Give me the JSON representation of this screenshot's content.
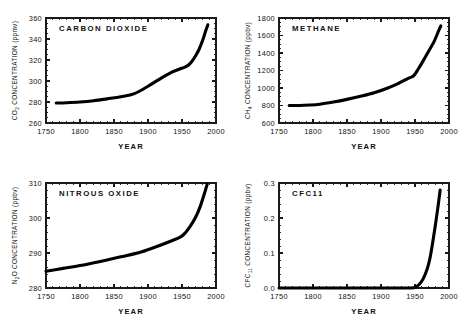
{
  "figure": {
    "background": "#ffffff",
    "ink": "#000000",
    "panel_count": 4
  },
  "chart_data": [
    {
      "type": "line",
      "title": "CARBON  DIOXIDE",
      "species": "CO2",
      "xlabel": "YEAR",
      "ylabel_main": "CO",
      "ylabel_sub": "2",
      "ylabel_tail": " CONCENTRATION (ppmv)",
      "units": "ppmv",
      "xlim": [
        1750,
        2000
      ],
      "ylim": [
        260,
        360
      ],
      "xticks": [
        1750,
        1800,
        1850,
        1900,
        1950,
        2000
      ],
      "yticks": [
        260,
        280,
        300,
        320,
        340,
        360
      ],
      "xtick_labels": [
        "1750",
        "1800",
        "1850",
        "1900",
        "1950",
        "2000"
      ],
      "ytick_labels": [
        "260",
        "280",
        "300",
        "320",
        "340",
        "360"
      ],
      "x_minor_step": 10,
      "y_minor_step": 5,
      "grid": false,
      "legend": "none",
      "x": [
        1765,
        1780,
        1800,
        1820,
        1840,
        1860,
        1880,
        1900,
        1920,
        1935,
        1945,
        1955,
        1960,
        1965,
        1970,
        1975,
        1980,
        1985,
        1988
      ],
      "y": [
        279.0,
        279.3,
        280.0,
        281.2,
        283.0,
        285.0,
        288.0,
        295.0,
        303.0,
        308.5,
        311.0,
        313.5,
        315.5,
        319.0,
        324.0,
        330.0,
        338.0,
        348.0,
        353.5
      ]
    },
    {
      "type": "line",
      "title": "METHANE",
      "species": "CH4",
      "xlabel": "YEAR",
      "ylabel_main": "CH",
      "ylabel_sub": "4",
      "ylabel_tail": " CONCENTRATION (ppbv)",
      "units": "ppbv",
      "xlim": [
        1750,
        2000
      ],
      "ylim": [
        600,
        1800
      ],
      "xticks": [
        1750,
        1800,
        1850,
        1900,
        1950,
        2000
      ],
      "yticks": [
        600,
        800,
        1000,
        1200,
        1400,
        1600,
        1800
      ],
      "xtick_labels": [
        "1750",
        "1800",
        "1850",
        "1900",
        "1950",
        "2000"
      ],
      "ytick_labels": [
        "600",
        "800",
        "1000",
        "1200",
        "1400",
        "1600",
        "1800"
      ],
      "x_minor_step": 10,
      "y_minor_step": 50,
      "grid": false,
      "legend": "none",
      "x": [
        1765,
        1780,
        1795,
        1810,
        1830,
        1850,
        1870,
        1890,
        1910,
        1925,
        1940,
        1948,
        1955,
        1962,
        1970,
        1978,
        1984,
        1988
      ],
      "y": [
        800,
        800,
        805,
        815,
        840,
        870,
        905,
        945,
        1000,
        1050,
        1110,
        1140,
        1220,
        1310,
        1420,
        1530,
        1640,
        1710
      ]
    },
    {
      "type": "line",
      "title": "NITROUS  OXIDE",
      "species": "N2O",
      "xlabel": "YEAR",
      "ylabel_main": "N",
      "ylabel_sub": "2",
      "ylabel_tail": "O CONCENTRATION (ppbv)",
      "units": "ppbv",
      "xlim": [
        1750,
        2000
      ],
      "ylim": [
        280,
        310
      ],
      "xticks": [
        1750,
        1800,
        1850,
        1900,
        1950,
        2000
      ],
      "yticks": [
        280,
        290,
        300,
        310
      ],
      "xtick_labels": [
        "1750",
        "1800",
        "1850",
        "1900",
        "1950",
        "2000"
      ],
      "ytick_labels": [
        "280",
        "290",
        "300",
        "310"
      ],
      "x_minor_step": 10,
      "y_minor_step": 2,
      "grid": false,
      "legend": "none",
      "x": [
        1750,
        1775,
        1800,
        1830,
        1860,
        1890,
        1915,
        1935,
        1948,
        1955,
        1962,
        1970,
        1977,
        1983,
        1987
      ],
      "y": [
        284.8,
        285.6,
        286.4,
        287.6,
        288.9,
        290.3,
        292.0,
        293.5,
        294.6,
        295.8,
        297.6,
        300.2,
        303.4,
        307.0,
        309.6
      ]
    },
    {
      "type": "line",
      "title": "CFC11",
      "species": "CFC11",
      "xlabel": "YEAR",
      "ylabel_main": "CFC",
      "ylabel_sub": "11",
      "ylabel_tail": " CONCENTRATION (ppbv)",
      "units": "ppbv",
      "xlim": [
        1750,
        2000
      ],
      "ylim": [
        0.0,
        0.3
      ],
      "xticks": [
        1750,
        1800,
        1850,
        1900,
        1950,
        2000
      ],
      "yticks": [
        0.0,
        0.1,
        0.2,
        0.3
      ],
      "xtick_labels": [
        "1750",
        "1800",
        "1850",
        "1900",
        "1950",
        "2000"
      ],
      "ytick_labels": [
        "0.0",
        "0.1",
        "0.2",
        "0.3"
      ],
      "x_minor_step": 10,
      "y_minor_step": 0.02,
      "grid": false,
      "legend": "none",
      "x": [
        1750,
        1900,
        1940,
        1950,
        1956,
        1962,
        1968,
        1972,
        1976,
        1980,
        1984,
        1987
      ],
      "y": [
        0.0,
        0.0,
        0.0,
        0.002,
        0.01,
        0.026,
        0.055,
        0.085,
        0.13,
        0.18,
        0.235,
        0.28
      ]
    }
  ]
}
